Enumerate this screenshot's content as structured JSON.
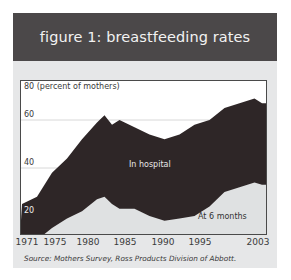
{
  "figure": {
    "title": "figure 1: breastfeeding rates",
    "source": "Source: Mothers Survey, Ross Products Division of Abbott.",
    "colors": {
      "header_bg": "#4b4849",
      "card_bg": "#e6e7e8",
      "in_hospital": "#2e2627",
      "at_6_months": "#dfe1e2",
      "plot_bg": "#ffffff",
      "gridline": "#d8d8d8"
    }
  },
  "chart_data": {
    "type": "area",
    "title": "figure 1: breastfeeding rates",
    "xlabel": "",
    "ylabel": "(percent of mothers)",
    "ylim": [
      8,
      80
    ],
    "xlim": [
      1971,
      2003.5
    ],
    "grid": true,
    "y_ticks": [
      {
        "value": 80,
        "label": "80 (percent of mothers)"
      },
      {
        "value": 60,
        "label": "60"
      },
      {
        "value": 40,
        "label": "40"
      },
      {
        "value": 20,
        "label": "20"
      }
    ],
    "x_ticks": [
      "1971",
      "1975",
      "1980",
      "1985",
      "1990",
      "1995",
      "2003"
    ],
    "legend": "inline labels",
    "x": [
      1971,
      1973,
      1975,
      1977,
      1979,
      1981,
      1982,
      1983,
      1984,
      1986,
      1988,
      1990,
      1992,
      1994,
      1996,
      1998,
      2000,
      2002,
      2003
    ],
    "series": [
      {
        "name": "In hospital",
        "values": [
          25,
          28,
          38,
          44,
          52,
          59,
          62,
          58,
          60,
          57,
          54,
          52,
          54,
          58,
          60,
          65,
          67,
          69,
          67
        ]
      },
      {
        "name": "At 6 months",
        "values": [
          9,
          10,
          15,
          19,
          22,
          27,
          28,
          25,
          23,
          23,
          20,
          18,
          19,
          20,
          24,
          30,
          32,
          34,
          33
        ]
      }
    ]
  }
}
